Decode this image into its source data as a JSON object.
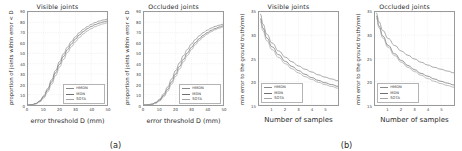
{
  "figure": {
    "subfigures": [
      {
        "caption": "(a)"
      },
      {
        "caption": "(b)"
      }
    ]
  },
  "legend": {
    "entries": [
      {
        "label": "HMDN",
        "color": "#8a8a8a"
      },
      {
        "label": "MDN",
        "color": "#6f6f6f"
      },
      {
        "label": "SOTA",
        "color": "#a5a5a5"
      }
    ]
  },
  "chart_data": [
    {
      "type": "line",
      "title": "Visible joints",
      "xlabel": "error threshold D (mm)",
      "ylabel": "proportion of joints within error < D",
      "xlim": [
        0,
        50
      ],
      "ylim": [
        0,
        90
      ],
      "xticks": [
        0,
        10,
        20,
        30,
        40,
        50
      ],
      "yticks": [
        0,
        10,
        20,
        30,
        40,
        50,
        60,
        70,
        80,
        90
      ],
      "grid": true,
      "legend_position": "lower right",
      "x": [
        0,
        2.5,
        5,
        7.5,
        10,
        12.5,
        15,
        17.5,
        20,
        22.5,
        25,
        27.5,
        30,
        32.5,
        35,
        37.5,
        40,
        42.5,
        45,
        47.5,
        50
      ],
      "series": [
        {
          "name": "HMDN",
          "values": [
            0,
            0.4,
            1.6,
            4.2,
            9.0,
            16.0,
            24.5,
            33.5,
            42.0,
            49.5,
            56.0,
            61.5,
            66.0,
            70.0,
            73.2,
            75.8,
            78.0,
            79.8,
            81.2,
            82.2,
            83.0
          ]
        },
        {
          "name": "MDN",
          "values": [
            0,
            0.3,
            1.3,
            3.6,
            8.0,
            14.5,
            22.5,
            31.2,
            39.5,
            47.0,
            53.5,
            59.0,
            63.8,
            67.8,
            71.0,
            73.8,
            76.0,
            77.8,
            79.2,
            80.3,
            81.2
          ]
        },
        {
          "name": "SOTA",
          "values": [
            0,
            0.2,
            1.0,
            3.0,
            6.8,
            12.8,
            20.2,
            28.5,
            36.8,
            44.2,
            50.8,
            56.4,
            61.2,
            65.3,
            68.8,
            71.6,
            73.9,
            75.8,
            77.3,
            78.5,
            79.5
          ]
        }
      ]
    },
    {
      "type": "line",
      "title": "Occluded joints",
      "xlabel": "error threshold D (mm)",
      "ylabel": "proportion of joints within error < D",
      "xlim": [
        0,
        50
      ],
      "ylim": [
        0,
        90
      ],
      "xticks": [
        0,
        10,
        20,
        30,
        40,
        50
      ],
      "yticks": [
        0,
        10,
        20,
        30,
        40,
        50,
        60,
        70,
        80,
        90
      ],
      "grid": true,
      "legend_position": "lower right",
      "x": [
        0,
        2.5,
        5,
        7.5,
        10,
        12.5,
        15,
        17.5,
        20,
        22.5,
        25,
        27.5,
        30,
        32.5,
        35,
        37.5,
        40,
        42.5,
        45,
        47.5,
        50
      ],
      "series": [
        {
          "name": "HMDN",
          "values": [
            0,
            0.2,
            0.9,
            2.6,
            5.8,
            10.8,
            17.5,
            25.2,
            33.2,
            40.8,
            47.8,
            53.8,
            59.0,
            63.4,
            67.0,
            70.0,
            72.4,
            74.4,
            76.0,
            77.2,
            78.2
          ]
        },
        {
          "name": "MDN",
          "values": [
            0,
            0.15,
            0.7,
            2.1,
            4.8,
            9.2,
            15.2,
            22.4,
            30.0,
            37.4,
            44.3,
            50.4,
            55.8,
            60.4,
            64.2,
            67.4,
            70.0,
            72.2,
            74.0,
            75.4,
            76.6
          ]
        },
        {
          "name": "SOTA",
          "values": [
            0,
            0.1,
            0.5,
            1.7,
            4.0,
            7.9,
            13.4,
            20.2,
            27.6,
            34.9,
            41.8,
            48.0,
            53.6,
            58.4,
            62.4,
            65.8,
            68.6,
            70.9,
            72.8,
            74.3,
            75.6
          ]
        }
      ]
    },
    {
      "type": "line",
      "title": "Visible joints",
      "xlabel": "Number of samples",
      "ylabel": "min error to the ground truth(mm)",
      "xlim": [
        0,
        6
      ],
      "ylim": [
        15,
        35
      ],
      "xticks": [
        1,
        2,
        3,
        4,
        5
      ],
      "yticks": [
        15,
        20,
        25,
        30,
        35
      ],
      "grid": true,
      "legend_position": "lower left",
      "x": [
        0.12,
        0.3,
        0.6,
        1.0,
        1.5,
        2.0,
        2.5,
        3.0,
        3.5,
        4.0,
        4.5,
        5.0,
        5.5,
        6.0
      ],
      "series": [
        {
          "name": "HMDN",
          "values": [
            34.6,
            32.4,
            30.2,
            28.3,
            26.6,
            25.3,
            24.3,
            23.4,
            22.7,
            22.1,
            21.5,
            21.0,
            20.6,
            20.2
          ]
        },
        {
          "name": "MDN",
          "values": [
            33.6,
            31.5,
            29.4,
            27.5,
            25.8,
            24.4,
            23.3,
            22.4,
            21.6,
            20.9,
            20.3,
            19.8,
            19.4,
            19.0
          ]
        },
        {
          "name": "SOTA",
          "values": [
            33.0,
            30.9,
            28.8,
            26.9,
            25.2,
            23.9,
            22.8,
            21.9,
            21.1,
            20.5,
            19.9,
            19.4,
            19.0,
            18.6
          ]
        }
      ]
    },
    {
      "type": "line",
      "title": "Occluded joints",
      "xlabel": "Number of samples",
      "ylabel": "min error to the ground truth(mm)",
      "xlim": [
        0,
        6
      ],
      "ylim": [
        15,
        35
      ],
      "xticks": [
        1,
        2,
        3,
        4,
        5
      ],
      "yticks": [
        15,
        20,
        25,
        30,
        35
      ],
      "grid": true,
      "legend_position": "lower left",
      "x": [
        0.12,
        0.3,
        0.6,
        1.0,
        1.5,
        2.0,
        2.5,
        3.0,
        3.5,
        4.0,
        4.5,
        5.0,
        5.5,
        6.0
      ],
      "series": [
        {
          "name": "HMDN",
          "values": [
            34.8,
            32.9,
            31.0,
            29.3,
            27.8,
            26.6,
            25.7,
            24.9,
            24.2,
            23.6,
            23.1,
            22.7,
            22.3,
            21.9
          ]
        },
        {
          "name": "MDN",
          "values": [
            34.2,
            32.0,
            29.8,
            27.8,
            26.0,
            24.6,
            23.5,
            22.6,
            21.8,
            21.2,
            20.6,
            20.1,
            19.7,
            19.3
          ]
        },
        {
          "name": "SOTA",
          "values": [
            33.8,
            31.6,
            29.4,
            27.4,
            25.6,
            24.2,
            23.1,
            22.2,
            21.4,
            20.7,
            20.1,
            19.6,
            19.2,
            18.8
          ]
        }
      ]
    }
  ]
}
